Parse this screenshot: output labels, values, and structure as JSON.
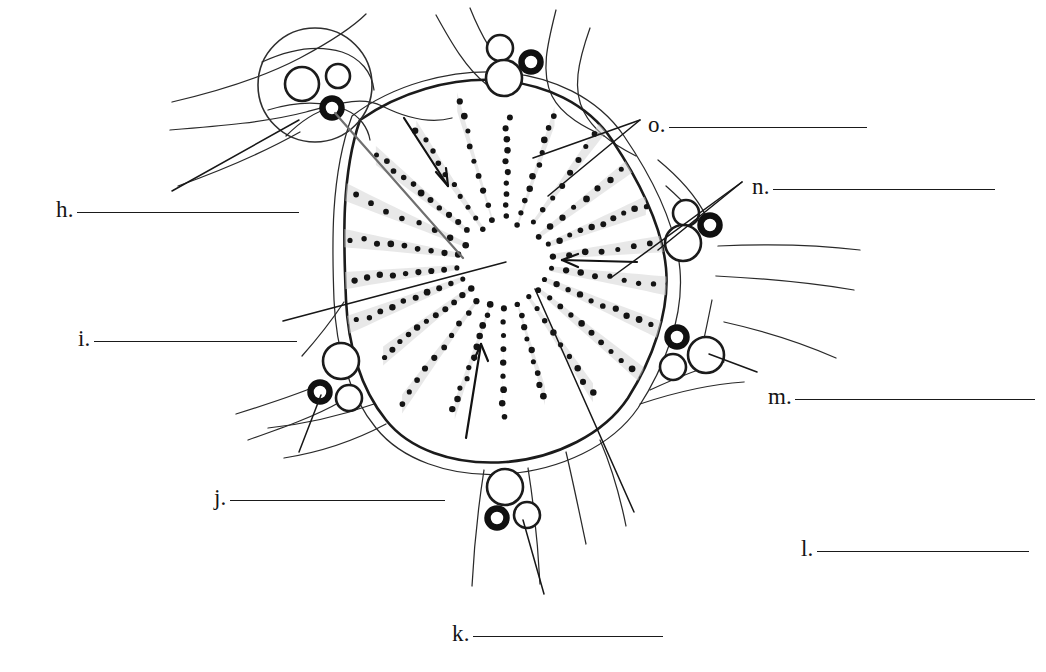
{
  "figure": {
    "type": "biology-cell-diagram",
    "background_color": "#ffffff",
    "ink_color": "#1b1b1b"
  },
  "labels": [
    {
      "id": "h",
      "letter": "h.",
      "answer": "",
      "x": 56,
      "y": 198,
      "blank_width": 222
    },
    {
      "id": "i",
      "letter": "i.",
      "answer": "",
      "x": 78,
      "y": 327,
      "blank_width": 203
    },
    {
      "id": "j",
      "letter": "j.",
      "answer": "",
      "x": 214,
      "y": 486,
      "blank_width": 215
    },
    {
      "id": "k",
      "letter": "k.",
      "answer": "",
      "x": 452,
      "y": 622,
      "blank_width": 190
    },
    {
      "id": "l",
      "letter": "l.",
      "answer": "",
      "x": 801,
      "y": 537,
      "blank_width": 212
    },
    {
      "id": "m",
      "letter": "m.",
      "answer": "",
      "x": 768,
      "y": 385,
      "blank_width": 240
    },
    {
      "id": "n",
      "letter": "n.",
      "answer": "",
      "x": 752,
      "y": 175,
      "blank_width": 222
    },
    {
      "id": "o",
      "letter": "o.",
      "answer": "",
      "x": 648,
      "y": 113,
      "blank_width": 198
    }
  ],
  "structures": {
    "magnifier_inset": {
      "cx": 315,
      "cy": 85,
      "r": 57,
      "note": "circular magnified view at upper left"
    },
    "vesicle_clusters": [
      {
        "name": "upper-left-inset-cluster",
        "cx": 310,
        "cy": 92
      },
      {
        "name": "top-cluster",
        "cx": 513,
        "cy": 63
      },
      {
        "name": "right-upper-cluster",
        "cx": 690,
        "cy": 228
      },
      {
        "name": "right-lower-cluster",
        "cx": 690,
        "cy": 355
      },
      {
        "name": "lower-left-cluster",
        "cx": 338,
        "cy": 376
      },
      {
        "name": "bottom-cluster",
        "cx": 508,
        "cy": 498
      }
    ],
    "radial_center": {
      "cx": 505,
      "cy": 262
    },
    "spoke_count": 22,
    "arrows": [
      {
        "name": "arrow-upper-left-to-center",
        "from": [
          404,
          118
        ],
        "to": [
          447,
          185
        ]
      },
      {
        "name": "arrow-right-to-center",
        "from": [
          637,
          262
        ],
        "to": [
          561,
          260
        ]
      },
      {
        "name": "arrow-lower-to-center",
        "from": [
          466,
          436
        ],
        "to": [
          481,
          344
        ]
      }
    ]
  }
}
